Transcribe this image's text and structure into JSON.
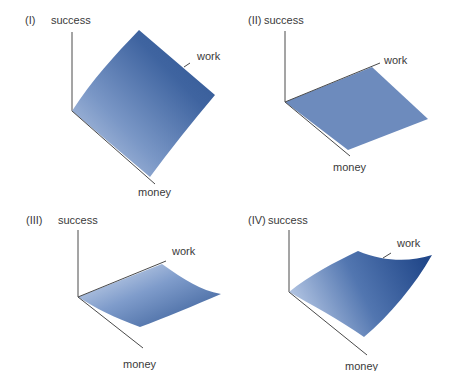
{
  "panels": [
    {
      "id": "I",
      "label": "(I)",
      "z_axis": "success",
      "x_axis": "work",
      "y_axis": "money",
      "shape": "concave rising surface (steep, curved)"
    },
    {
      "id": "II",
      "label": "(II)",
      "z_axis": "success",
      "x_axis": "work",
      "y_axis": "money",
      "shape": "flat plane"
    },
    {
      "id": "III",
      "label": "(III)",
      "z_axis": "success",
      "x_axis": "work",
      "y_axis": "money",
      "shape": "low surface curving upward along work"
    },
    {
      "id": "IV",
      "label": "(IV)",
      "z_axis": "success",
      "x_axis": "work",
      "y_axis": "money",
      "shape": "rising surface curving upward along work"
    }
  ],
  "colors": {
    "surface_dark": "#2f5591",
    "surface_light": "#b8c8e2",
    "flat_plane": "#6d8bbd",
    "axis": "#4a4a4a",
    "text": "#3a3a3a"
  }
}
